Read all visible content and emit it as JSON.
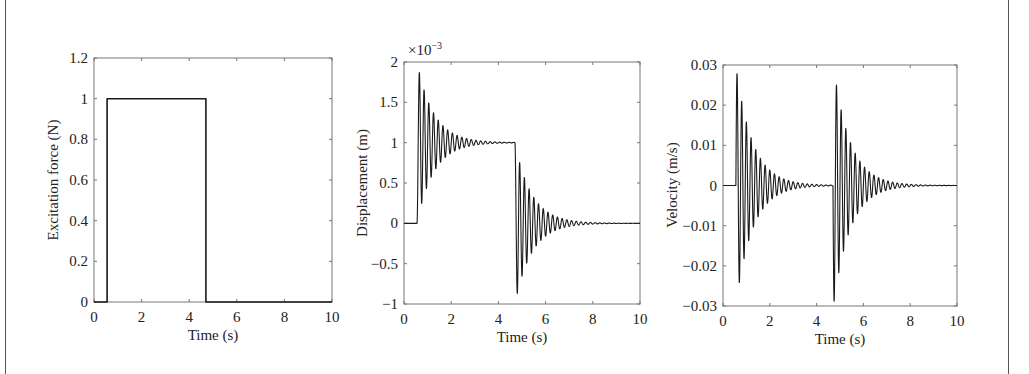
{
  "chart_data": [
    {
      "type": "line",
      "title": "",
      "xlabel": "Time (s)",
      "ylabel": "Excitation force (N)",
      "xlim": [
        0,
        10
      ],
      "ylim": [
        0,
        1.2
      ],
      "xticks": [
        "0",
        "2",
        "4",
        "6",
        "8",
        "10"
      ],
      "yticks": [
        "0",
        "0.2",
        "0.4",
        "0.6",
        "0.8",
        "1",
        "1.2"
      ],
      "grid": false,
      "series": [
        {
          "name": "Excitation force",
          "description": "Rectangular pulse of 1 N from t=0.55 s to t=4.7 s, zero elsewhere",
          "x": [
            0,
            0.55,
            0.55,
            4.7,
            4.7,
            10
          ],
          "y": [
            0,
            0,
            1,
            1,
            0,
            0
          ]
        }
      ]
    },
    {
      "type": "line",
      "title": "",
      "xlabel": "Time (s)",
      "ylabel": "Displacement (m)",
      "y_multiplier": "×10^-3",
      "xlim": [
        0,
        10
      ],
      "ylim": [
        -1,
        2
      ],
      "xticks": [
        "0",
        "2",
        "4",
        "6",
        "8",
        "10"
      ],
      "yticks": [
        "−1",
        "−0.5",
        "0",
        "0.5",
        "1",
        "1.5",
        "2"
      ],
      "grid": false,
      "series": [
        {
          "name": "Displacement",
          "description": "Damped oscillatory step response: rises at t=0.55 s, peaks ~1.85e-3, settles to 1e-3 by ~3.5 s; at t=4.7 s drops with trough ~-0.87e-3, settles to 0 by ~8 s",
          "oscillation_period_s": 0.2,
          "events": [
            {
              "t": 0.55,
              "from": 0,
              "to": 0.001,
              "first_peak": 0.00185,
              "first_trough": 0.00025
            },
            {
              "t": 4.7,
              "from": 0.001,
              "to": 0,
              "first_trough": -0.00087,
              "first_peak": 0.00073
            }
          ]
        }
      ]
    },
    {
      "type": "line",
      "title": "",
      "xlabel": "Time (s)",
      "ylabel": "Velocity (m/s)",
      "xlim": [
        0,
        10
      ],
      "ylim": [
        -0.03,
        0.03
      ],
      "xticks": [
        "0",
        "2",
        "4",
        "6",
        "8",
        "10"
      ],
      "yticks": [
        "−0.03",
        "−0.02",
        "−0.01",
        "0",
        "0.01",
        "0.02",
        "0.03"
      ],
      "grid": false,
      "series": [
        {
          "name": "Velocity",
          "description": "Two decaying oscillatory bursts: first at t=0.55 s starting positive (peak ~0.029, trough ~-0.025); second at t=4.7 s starting negative (trough ~-0.03, peak ~0.025); each decays to 0 within ~3.5 s",
          "oscillation_period_s": 0.2,
          "events": [
            {
              "t": 0.55,
              "first_peak": 0.029,
              "first_trough": -0.025
            },
            {
              "t": 4.7,
              "first_trough": -0.03,
              "first_peak": 0.025
            }
          ]
        }
      ]
    }
  ],
  "plots": {
    "force": {
      "ylabel": "Excitation force (N)",
      "xlabel": "Time (s)",
      "yticks": [
        "0",
        "0.2",
        "0.4",
        "0.6",
        "0.8",
        "1",
        "1.2"
      ],
      "xticks": [
        "0",
        "2",
        "4",
        "6",
        "8",
        "10"
      ]
    },
    "displacement": {
      "ylabel": "Displacement (m)",
      "xlabel": "Time (s)",
      "multiplier_base": "×10",
      "multiplier_exp": "−3",
      "yticks": [
        "−1",
        "−0.5",
        "0",
        "0.5",
        "1",
        "1.5",
        "2"
      ],
      "xticks": [
        "0",
        "2",
        "4",
        "6",
        "8",
        "10"
      ]
    },
    "velocity": {
      "ylabel": "Velocity (m/s)",
      "xlabel": "Time (s)",
      "yticks": [
        "−0.03",
        "−0.02",
        "−0.01",
        "0",
        "0.01",
        "0.02",
        "0.03"
      ],
      "xticks": [
        "0",
        "2",
        "4",
        "6",
        "8",
        "10"
      ]
    }
  }
}
